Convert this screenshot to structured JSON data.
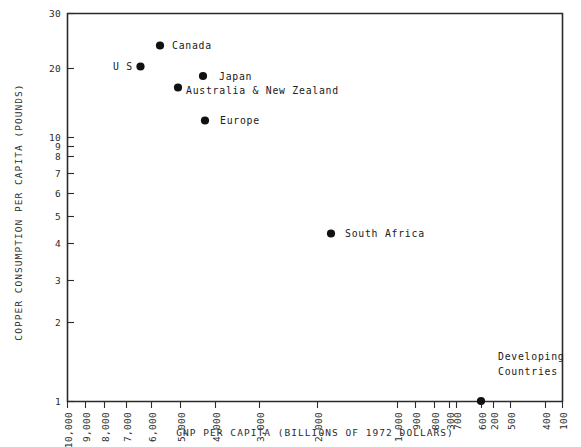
{
  "chart_data": {
    "type": "scatter",
    "title": "",
    "xlabel": "GNP PER CAPITA (BILLIONS OF 1972 DOLLARS)",
    "ylabel": "COPPER CONSUMPTION PER CAPITA (POUNDS)",
    "xscale": "log-reversed",
    "yscale": "log",
    "xlim": [
      10000,
      100
    ],
    "ylim": [
      1,
      30
    ],
    "grid": false,
    "legend": null,
    "xticks": [
      "10,000",
      "9,000",
      "8,000",
      "7,000",
      "6,000",
      "5,000",
      "4,000",
      "3,000",
      "2,000",
      "1,000",
      "900",
      "800",
      "700",
      "600",
      "500",
      "400",
      "300",
      "200",
      "100"
    ],
    "xtick_values": [
      10000,
      9000,
      8000,
      7000,
      6000,
      5000,
      4000,
      3000,
      2000,
      1000,
      900,
      800,
      700,
      600,
      500,
      400,
      300,
      200,
      100
    ],
    "yticks": [
      "1",
      "2",
      "3",
      "4",
      "5",
      "6",
      "7",
      "8",
      "9",
      "10",
      "20",
      "30"
    ],
    "ytick_values": [
      1,
      2,
      3,
      4,
      5,
      6,
      7,
      8,
      9,
      10,
      20,
      30
    ],
    "points": [
      {
        "label": "Canada",
        "x": 4600,
        "y": 23.2,
        "label_side": "right"
      },
      {
        "label": "U S",
        "x": 5300,
        "y": 19.6,
        "label_side": "left"
      },
      {
        "label": "Japan",
        "x": 3150,
        "y": 17.6,
        "label_side": "right"
      },
      {
        "label": "Australia & New Zealand",
        "x": 3750,
        "y": 16.2,
        "label_side": "right"
      },
      {
        "label": "Europe",
        "x": 3050,
        "y": 11.6,
        "label_side": "right"
      },
      {
        "label": "South Africa",
        "x": 880,
        "y": 4.3,
        "label_side": "right"
      },
      {
        "label": "",
        "x": 235,
        "y": 1.0,
        "label_side": "none"
      }
    ],
    "annotations": [
      {
        "text_line1": "Developing",
        "text_line2": "Countries",
        "x": 330,
        "y": 1.45
      }
    ]
  },
  "style": {
    "axis_color": "#2b2b2b",
    "marker_color": "#111111",
    "text_color": "#202020",
    "background": "#ffffff"
  }
}
